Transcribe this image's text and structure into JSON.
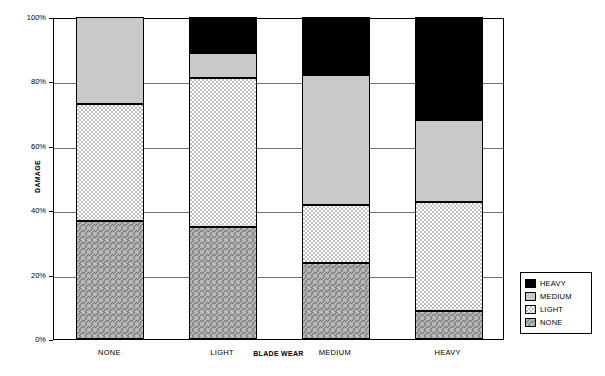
{
  "chart_data": {
    "type": "bar",
    "subtype": "stacked-100-percent",
    "title": "",
    "xlabel": "BLADE WEAR",
    "ylabel": "DAMAGE",
    "categories": [
      "NONE",
      "LIGHT",
      "MEDIUM",
      "HEAVY"
    ],
    "ylim": [
      0,
      100
    ],
    "ytick_labels": [
      "0%",
      "20%",
      "40%",
      "60%",
      "80%",
      "100%"
    ],
    "ytick_values": [
      0,
      20,
      40,
      60,
      80,
      100
    ],
    "grid": true,
    "legend_position": "right",
    "series": [
      {
        "name": "NONE",
        "fill": "diagonal-hatch",
        "color": "#b3b3b3",
        "values": [
          36.8,
          34.8,
          23.5,
          8.8
        ]
      },
      {
        "name": "LIGHT",
        "fill": "dotted",
        "color": "#ffffff",
        "values": [
          36.2,
          46.2,
          18.0,
          33.7
        ]
      },
      {
        "name": "MEDIUM",
        "fill": "solid-gray",
        "color": "#c8c8c8",
        "values": [
          27.0,
          7.8,
          40.5,
          25.5
        ]
      },
      {
        "name": "HEAVY",
        "fill": "solid-black",
        "color": "#000000",
        "values": [
          0.0,
          11.2,
          18.0,
          32.0
        ]
      }
    ],
    "legend_entries": [
      "HEAVY",
      "MEDIUM",
      "LIGHT",
      "NONE"
    ]
  }
}
